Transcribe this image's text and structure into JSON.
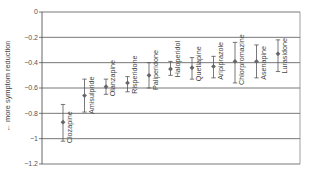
{
  "chart_data": {
    "type": "scatter",
    "subtype": "point-estimate-with-error-bars",
    "title": "",
    "xlabel": "",
    "ylabel": "← more symptom reduction",
    "ylim": [
      -1.2,
      0
    ],
    "yticks": [
      0,
      -0.2,
      -0.4,
      -0.6,
      -0.8,
      -1,
      -1.2
    ],
    "ytick_labels": [
      "0",
      "−0.2",
      "−0.4",
      "−0.6",
      "−0.8",
      "−1",
      "−1.2"
    ],
    "grid": "horizontal",
    "legend": "none",
    "categories": [
      "Clozapine",
      "Amisulpride",
      "Olanzapine",
      "Risperidone",
      "Paliperidone",
      "Haloperidol",
      "Quetiapine",
      "Aripiprazole",
      "Chlorpromazine",
      "Asenapine",
      "Lurasidone"
    ],
    "series": [
      {
        "name": "Effect size",
        "values": [
          -0.87,
          -0.66,
          -0.59,
          -0.56,
          -0.5,
          -0.45,
          -0.44,
          -0.43,
          -0.39,
          -0.39,
          -0.33
        ],
        "lower": [
          -1.02,
          -0.79,
          -0.65,
          -0.63,
          -0.6,
          -0.5,
          -0.53,
          -0.52,
          -0.56,
          -0.52,
          -0.47
        ],
        "upper": [
          -0.73,
          -0.53,
          -0.53,
          -0.51,
          -0.4,
          -0.39,
          -0.36,
          -0.35,
          -0.24,
          -0.26,
          -0.22
        ]
      }
    ],
    "colors": {
      "marker": "#666666",
      "errorbar": "#555555",
      "grid": "#555555",
      "text": "#444444"
    }
  }
}
